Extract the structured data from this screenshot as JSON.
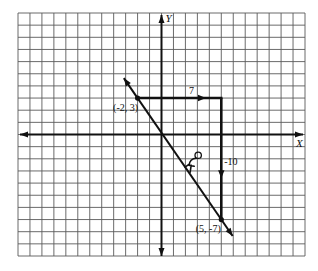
{
  "chart_data": {
    "type": "line",
    "title": "",
    "xlabel": "X",
    "ylabel": "Y",
    "xlim": [
      -12,
      12
    ],
    "ylim": [
      -10,
      10
    ],
    "grid": true,
    "legend": null,
    "series": [
      {
        "name": "line through (-2, 3) and (5, -7)",
        "x": [
          -2,
          5
        ],
        "y": [
          3,
          -7
        ],
        "extent_x": [
          -3.15,
          5.95
        ]
      }
    ],
    "points": [
      {
        "x": -2,
        "y": 3,
        "label": "(-2, 3)"
      },
      {
        "x": 5,
        "y": -7,
        "label": "(5, -7)"
      }
    ],
    "annotations": [
      {
        "kind": "run",
        "text": "7",
        "from": [
          -2,
          3
        ],
        "to": [
          5,
          3
        ],
        "arrow_at": 3.72
      },
      {
        "kind": "rise",
        "text": "-10",
        "from": [
          5,
          3
        ],
        "to": [
          5,
          -7
        ],
        "arrow_at": -3.6
      }
    ],
    "decorations": [
      {
        "icon": "sliding-person-icon",
        "near": [
          2.9,
          -2.2
        ]
      }
    ]
  },
  "colors": {
    "background": "#ffffff",
    "grid": "#5a5a5a",
    "ink": "#111111"
  }
}
